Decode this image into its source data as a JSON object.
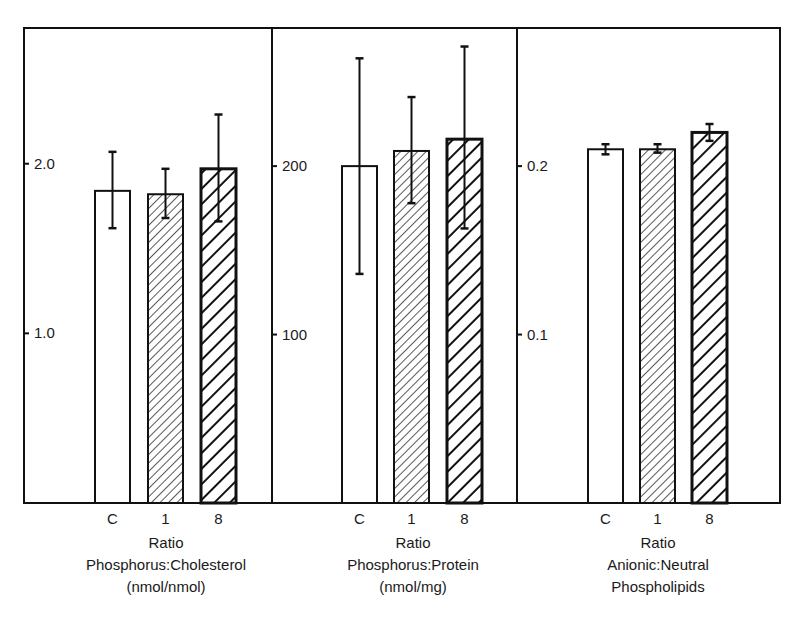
{
  "chart_data": [
    {
      "type": "bar",
      "title": "",
      "xlabel": "Ratio Phosphorus:Cholesterol (nmol/nmol)",
      "ylabel": "",
      "categories": [
        "C",
        "1",
        "8"
      ],
      "values": [
        1.84,
        1.82,
        1.97
      ],
      "error_low": [
        1.62,
        1.68,
        1.66
      ],
      "error_high": [
        2.07,
        1.97,
        2.29
      ],
      "yticks": [
        1.0,
        2.0
      ],
      "ytick_labels": [
        "1.0",
        "2.0"
      ],
      "ylim": [
        0,
        2.8
      ],
      "grid": false,
      "patterns": [
        "open",
        "fine-hatch",
        "bold-hatch"
      ]
    },
    {
      "type": "bar",
      "title": "",
      "xlabel": "Ratio Phosphorus:Protein (nmol/mg)",
      "ylabel": "",
      "categories": [
        "C",
        "1",
        "8"
      ],
      "values": [
        200,
        209,
        216
      ],
      "error_low": [
        136,
        178,
        163
      ],
      "error_high": [
        264,
        241,
        271
      ],
      "yticks": [
        100,
        200
      ],
      "ytick_labels": [
        "100",
        "200"
      ],
      "ylim": [
        0,
        282
      ],
      "grid": false,
      "patterns": [
        "open",
        "fine-hatch",
        "bold-hatch"
      ]
    },
    {
      "type": "bar",
      "title": "",
      "xlabel": "Ratio Anionic:Neutral Phospholipids",
      "ylabel": "",
      "categories": [
        "C",
        "1",
        "8"
      ],
      "values": [
        0.21,
        0.21,
        0.22
      ],
      "error_low": [
        0.207,
        0.208,
        0.215
      ],
      "error_high": [
        0.213,
        0.213,
        0.225
      ],
      "yticks": [
        0.1,
        0.2
      ],
      "ytick_labels": [
        "0.1",
        "0.2"
      ],
      "ylim": [
        0,
        0.282
      ],
      "grid": false,
      "patterns": [
        "open",
        "fine-hatch",
        "bold-hatch"
      ]
    }
  ],
  "captions": [
    {
      "line1": "Ratio",
      "line2": "Phosphorus:Cholesterol",
      "line3": "(nmol/nmol)"
    },
    {
      "line1": "Ratio",
      "line2": "Phosphorus:Protein",
      "line3": "(nmol/mg)"
    },
    {
      "line1": "Ratio",
      "line2": "Anionic:Neutral",
      "line3": "Phospholipids"
    }
  ],
  "colors": {
    "ink": "#111111",
    "background": "#ffffff"
  }
}
